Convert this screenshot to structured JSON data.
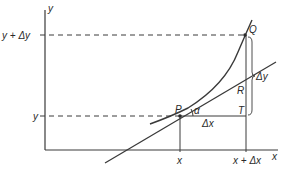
{
  "diagram": {
    "type": "derivative-geometry",
    "axes": {
      "x_label": "x",
      "y_label": "y"
    },
    "tick_labels": {
      "x": "x",
      "x_plus_dx": "x + Δx",
      "y": "y",
      "y_plus_dy": "y + Δy"
    },
    "points": {
      "P": "P",
      "Q": "Q",
      "R": "R",
      "T": "T"
    },
    "annotations": {
      "angle": "α",
      "delta_x": "Δx",
      "delta_y": "Δy"
    },
    "colors": {
      "stroke": "#3a3a3a",
      "background": "#ffffff"
    }
  }
}
